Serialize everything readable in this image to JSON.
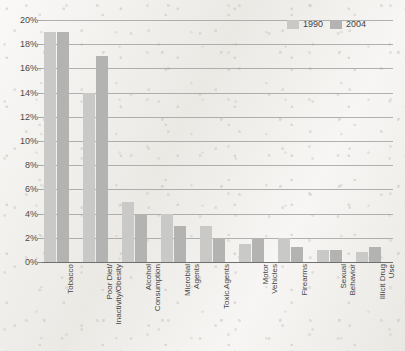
{
  "chart_data": {
    "type": "bar",
    "title": "",
    "xlabel": "",
    "ylabel": "",
    "ylim": [
      0,
      20
    ],
    "ytick_labels": [
      "20%",
      "18%",
      "16%",
      "14%",
      "12%",
      "10%",
      "8%",
      "6%",
      "4%",
      "2%",
      "0%"
    ],
    "ytick_values": [
      20,
      18,
      16,
      14,
      12,
      10,
      8,
      6,
      4,
      2,
      0
    ],
    "grid": true,
    "legend_position": "top-right",
    "categories": [
      "Tobacco",
      "Poor Diet/\nInactivity/Obesity",
      "Alcohol\nConsumption",
      "Microbial\nAgents",
      "Toxic Agents",
      "Motor\nVehicles",
      "Firearms",
      "Sexual\nBehavior",
      "Illicit Drug\nUse"
    ],
    "series": [
      {
        "name": "1990",
        "color": "#c9c9c7",
        "values": [
          19,
          14,
          5,
          4,
          3,
          1.5,
          2,
          1,
          0.8
        ]
      },
      {
        "name": "2004",
        "color": "#b3b3b1",
        "values": [
          19,
          17,
          4,
          3,
          2,
          2,
          1.2,
          1,
          1.2
        ]
      }
    ]
  },
  "legend": {
    "items": [
      {
        "label": "1990"
      },
      {
        "label": "2004"
      }
    ]
  }
}
